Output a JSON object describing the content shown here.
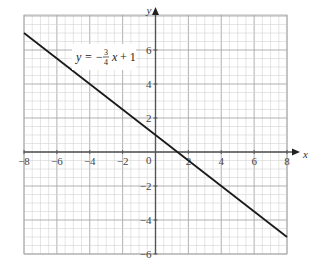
{
  "chart_data": {
    "type": "line",
    "title": "",
    "xlabel": "x",
    "ylabel": "y",
    "xlim": [
      -8,
      8
    ],
    "ylim": [
      -6,
      7.5
    ],
    "grid": true,
    "minor_grid_step": 0.5,
    "major_grid_step": 2,
    "x_ticks": [
      -8,
      -6,
      -4,
      -2,
      2,
      4,
      6,
      8
    ],
    "x_tick_labels": [
      "−8",
      "−6",
      "−4",
      "−2",
      "2",
      "4",
      "6",
      "8"
    ],
    "y_ticks": [
      6,
      4,
      2,
      -2,
      -4,
      -6
    ],
    "y_tick_labels": [
      "6",
      "4",
      "2",
      "−2",
      "−4",
      "−6"
    ],
    "origin_label": "0",
    "series": [
      {
        "name": "y = -3/4 x + 1",
        "slope": -0.75,
        "intercept": 1,
        "x": [
          -8,
          8
        ],
        "y": [
          7,
          -5
        ],
        "color": "#1a1a1a"
      }
    ],
    "annotations": [
      {
        "text": "y = −3/4 x + 1",
        "parts": {
          "lhs": "y",
          "eq": "=",
          "sign": "−",
          "num": "3",
          "den": "4",
          "var": "x",
          "tail": "+ 1"
        },
        "position": {
          "x": -3.5,
          "y": 5.8
        }
      }
    ],
    "colors": {
      "grid_minor": "#d4d4d4",
      "grid_major": "#a8a8a8",
      "axis": "#555555",
      "line": "#1a1a1a"
    }
  }
}
